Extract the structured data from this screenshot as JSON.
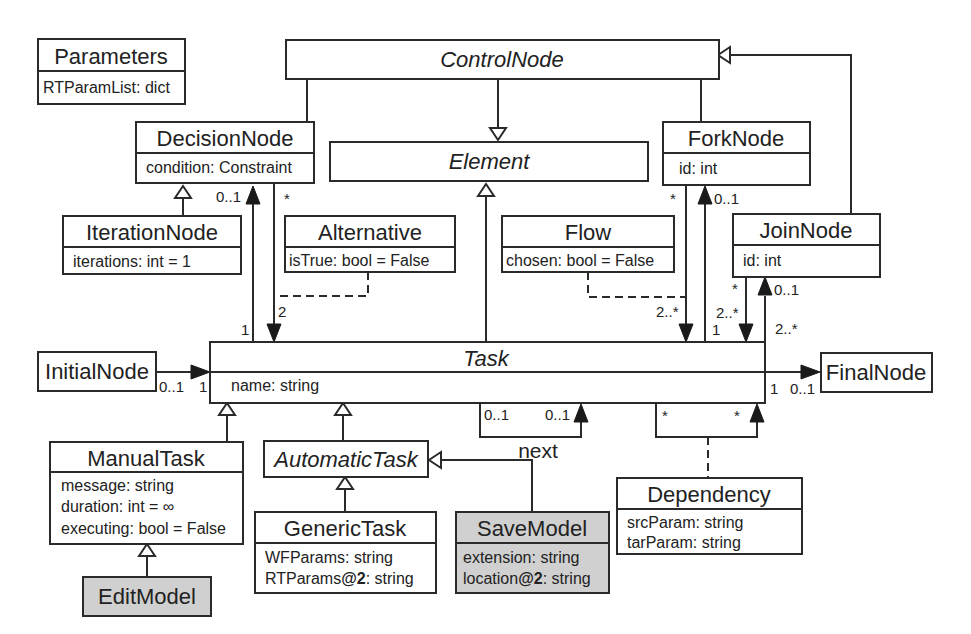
{
  "diagram": {
    "classes": {
      "parameters": {
        "name": "Parameters",
        "attrs": [
          "RTParamList: dict"
        ]
      },
      "control_node": {
        "name": "ControlNode",
        "abstract": true
      },
      "element": {
        "name": "Element",
        "abstract": true
      },
      "decision_node": {
        "name": "DecisionNode",
        "attrs": [
          "condition: Constraint"
        ]
      },
      "fork_node": {
        "name": "ForkNode",
        "attrs": [
          "id: int"
        ]
      },
      "join_node": {
        "name": "JoinNode",
        "attrs": [
          "id: int"
        ]
      },
      "iteration_node": {
        "name": "IterationNode",
        "attrs": [
          "iterations: int = 1"
        ]
      },
      "alternative": {
        "name": "Alternative",
        "attrs": [
          "isTrue: bool = False"
        ]
      },
      "flow": {
        "name": "Flow",
        "attrs": [
          "chosen: bool = False"
        ]
      },
      "initial_node": {
        "name": "InitialNode"
      },
      "final_node": {
        "name": "FinalNode"
      },
      "task": {
        "name": "Task",
        "abstract": true,
        "attrs": [
          "name: string"
        ]
      },
      "manual_task": {
        "name": "ManualTask",
        "attrs": [
          "message: string",
          "duration: int = ∞",
          "executing: bool = False"
        ]
      },
      "automatic_task": {
        "name": "AutomaticTask",
        "abstract": true
      },
      "generic_task": {
        "name": "GenericTask",
        "attrs": [
          "WFParams: string",
          "RTParams",
          "@2",
          ": string"
        ]
      },
      "save_model": {
        "name": "SaveModel",
        "shaded": true,
        "attrs": [
          "extension: string",
          "location",
          "@2",
          ": string"
        ]
      },
      "edit_model": {
        "name": "EditModel",
        "shaded": true
      },
      "dependency": {
        "name": "Dependency",
        "attrs": [
          "srcParam: string",
          "tarParam: string"
        ]
      }
    },
    "multiplicities": {
      "decision_up": "0..1",
      "decision_star": "*",
      "decision_task_1": "1",
      "decision_task_2": "2",
      "fork_star": "*",
      "fork_01": "0..1",
      "fork_task_2n": "2..*",
      "fork_task_1": "1",
      "join_star": "*",
      "join_01": "0..1",
      "join_task_2n_a": "2..*",
      "join_task_2n_b": "2..*",
      "initial_01": "0..1",
      "initial_1": "1",
      "final_1": "1",
      "final_01": "0..1",
      "next_01_a": "0..1",
      "next_01_b": "0..1",
      "dep_star_a": "*",
      "dep_star_b": "*"
    },
    "labels": {
      "next": "next"
    },
    "colors": {
      "line": "#2a2a2a",
      "shaded_fill": "#d0d0d0",
      "background": "#ffffff"
    }
  }
}
